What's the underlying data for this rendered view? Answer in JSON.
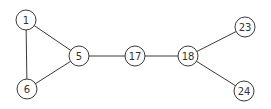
{
  "graph": {
    "colors": {
      "stroke": "#3a3a3a",
      "fill": "#ffffff",
      "text": "#333333"
    },
    "nodes": [
      {
        "id": "1",
        "label": "1",
        "x": 26,
        "y": 20
      },
      {
        "id": "5",
        "label": "5",
        "x": 79,
        "y": 56
      },
      {
        "id": "6",
        "label": "6",
        "x": 27,
        "y": 89
      },
      {
        "id": "17",
        "label": "17",
        "x": 135,
        "y": 56
      },
      {
        "id": "18",
        "label": "18",
        "x": 188,
        "y": 56
      },
      {
        "id": "23",
        "label": "23",
        "x": 245,
        "y": 27
      },
      {
        "id": "24",
        "label": "24",
        "x": 244,
        "y": 91
      }
    ],
    "edges": [
      [
        "1",
        "5"
      ],
      [
        "1",
        "6"
      ],
      [
        "5",
        "6"
      ],
      [
        "5",
        "17"
      ],
      [
        "17",
        "18"
      ],
      [
        "18",
        "23"
      ],
      [
        "18",
        "24"
      ]
    ]
  }
}
